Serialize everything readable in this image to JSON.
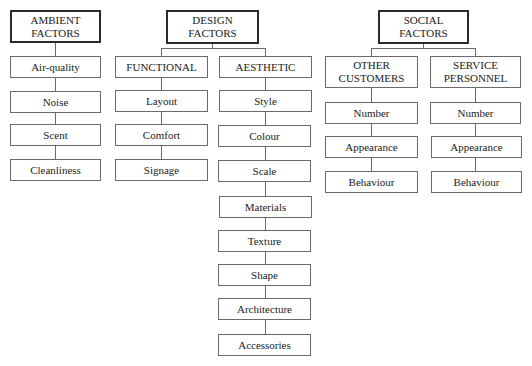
{
  "diagram": {
    "groups": [
      {
        "root": "AMBIENT\nFACTORS",
        "root_lines": [
          "AMBIENT",
          "FACTORS"
        ],
        "items": [
          "Air-quality",
          "Noise",
          "Scent",
          "Cleanliness"
        ]
      },
      {
        "root_lines": [
          "DESIGN",
          "FACTORS"
        ],
        "branches": [
          {
            "label": "FUNCTIONAL",
            "items": [
              "Layout",
              "Comfort",
              "Signage"
            ]
          },
          {
            "label": "AESTHETIC",
            "items": [
              "Style",
              "Colour",
              "Scale",
              "Materials",
              "Texture",
              "Shape",
              "Architecture",
              "Accessories"
            ]
          }
        ]
      },
      {
        "root_lines": [
          "SOCIAL",
          "FACTORS"
        ],
        "branches": [
          {
            "label_lines": [
              "OTHER",
              "CUSTOMERS"
            ],
            "items": [
              "Number",
              "Appearance",
              "Behaviour"
            ]
          },
          {
            "label_lines": [
              "SERVICE",
              "PERSONNEL"
            ],
            "items": [
              "Number",
              "Appearance",
              "Behaviour"
            ]
          }
        ]
      }
    ]
  }
}
